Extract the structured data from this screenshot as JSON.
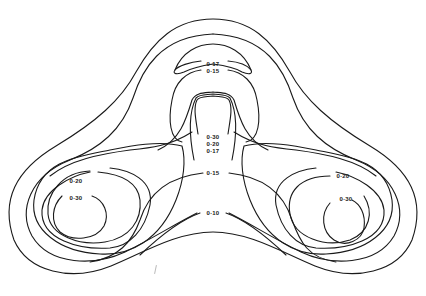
{
  "diagram": {
    "type": "isodose contour plot",
    "stroke_color": "#1a1a1a",
    "background": "#ffffff",
    "contour_levels": [
      "0·10",
      "0·15",
      "0·17",
      "0·20",
      "0·30"
    ],
    "labels": {
      "top_017": "0·17",
      "top_015": "0·15",
      "center_030": "0·30",
      "center_020": "0·20",
      "center_017": "0·17",
      "center_015": "0·15",
      "bottom_010": "0·10",
      "left_020": "0·20",
      "left_030": "0·30",
      "right_020": "0·20",
      "right_030": "0·30"
    }
  }
}
